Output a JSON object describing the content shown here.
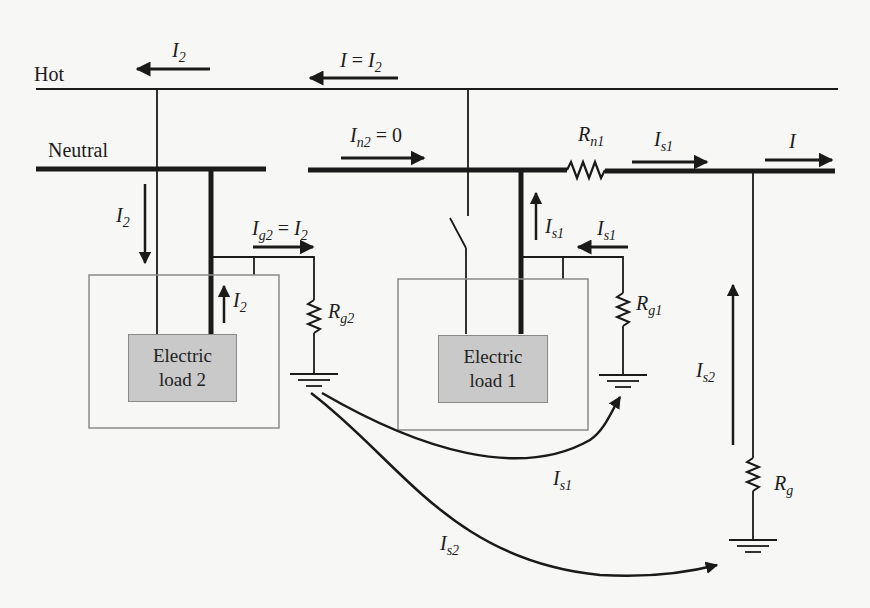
{
  "figure": {
    "wires": {
      "hot_label": "Hot",
      "neutral_label": "Neutral"
    },
    "loads": [
      {
        "line1": "Electric",
        "line2": "load 2"
      },
      {
        "line1": "Electric",
        "line2": "load 1"
      }
    ],
    "currents": {
      "hot_left": {
        "main": "I",
        "sub": "2"
      },
      "hot_right": {
        "main": "I",
        "eq": " = ",
        "main2": "I",
        "sub2": "2"
      },
      "neutral_down_left": {
        "main": "I",
        "sub": "2"
      },
      "ground_wire_2": {
        "main": "I",
        "sub": "g2",
        "eq": " = ",
        "main2": "I",
        "sub2": "2"
      },
      "load2_up": {
        "main": "I",
        "sub": "2"
      },
      "neutral_mid": {
        "main": "I",
        "sub": "n2",
        "eq": " = 0"
      },
      "neutral_up_load1": {
        "main": "I",
        "sub": "s1"
      },
      "ground_wire_1": {
        "main": "I",
        "sub": "s1"
      },
      "neutral_right": {
        "main": "I",
        "sub": "s1"
      },
      "neutral_far_right": {
        "main": "I"
      },
      "service_ground_up": {
        "main": "I",
        "sub": "s2"
      },
      "earth_path_1": {
        "main": "I",
        "sub": "s1"
      },
      "earth_path_2": {
        "main": "I",
        "sub": "s2"
      }
    },
    "resistors": {
      "neutral": {
        "main": "R",
        "sub": "n1"
      },
      "ground_load2": {
        "main": "R",
        "sub": "g2"
      },
      "ground_load1": {
        "main": "R",
        "sub": "g1"
      },
      "service_ground": {
        "main": "R",
        "sub": "g"
      }
    },
    "colors": {
      "line": "#1a1a1a",
      "load_fill": "#c9c9c9",
      "enclosure": "#8a8a8a",
      "page": "#f7f7f5"
    }
  }
}
